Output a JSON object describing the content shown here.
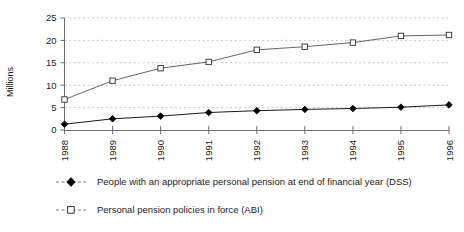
{
  "chart_data": {
    "type": "line",
    "title": "",
    "xlabel": "",
    "ylabel": "Millions",
    "categories": [
      "1988",
      "1989",
      "1990",
      "1991",
      "1992",
      "1993",
      "1994",
      "1995",
      "1996"
    ],
    "ylim": [
      0,
      25
    ],
    "yticks": [
      0,
      5,
      10,
      15,
      20,
      25
    ],
    "ytick_labels": [
      "0",
      "5",
      "10",
      "15",
      "20",
      "25"
    ],
    "grid": "horizontal-dashed",
    "legend_position": "below",
    "series": [
      {
        "name": "People with an appropriate personal pension at end of financial year (DSS)",
        "marker": "filled-diamond",
        "color": "#000000",
        "values": [
          1.3,
          2.5,
          3.1,
          3.9,
          4.3,
          4.6,
          4.8,
          5.1,
          5.6
        ]
      },
      {
        "name": "Personal pension policies in force (ABI)",
        "marker": "open-square",
        "color": "#555555",
        "values": [
          6.8,
          11.0,
          13.8,
          15.2,
          17.9,
          18.6,
          19.5,
          21.0,
          21.2
        ]
      }
    ]
  },
  "axis": {
    "y_title": "Millions"
  },
  "legend": {
    "items": [
      {
        "label": "People with an appropriate personal pension at end of financial year (DSS)"
      },
      {
        "label": "Personal pension policies in force (ABI)"
      }
    ]
  }
}
